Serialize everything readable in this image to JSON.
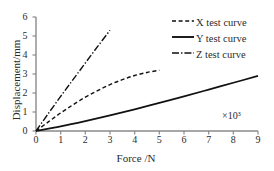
{
  "chart_data": {
    "type": "line",
    "title": "",
    "xlabel": "Force /N",
    "ylabel": "Displacement/mm",
    "x_multiplier": "×10³",
    "xlim": [
      0,
      9
    ],
    "ylim": [
      0,
      6
    ],
    "xticks": [
      0,
      1,
      2,
      3,
      4,
      5,
      6,
      7,
      8,
      9
    ],
    "yticks": [
      0,
      1,
      2,
      3,
      4,
      5,
      6
    ],
    "grid": false,
    "legend_position": "top-right",
    "series": [
      {
        "name": "X test curve",
        "style": "dashed",
        "color": "#111111",
        "x": [
          0,
          0.5,
          1.0,
          1.5,
          2.0,
          2.5,
          3.0,
          3.5,
          4.0,
          4.5,
          5.0
        ],
        "y": [
          0,
          0.48,
          0.95,
          1.38,
          1.78,
          2.12,
          2.44,
          2.7,
          2.92,
          3.08,
          3.2
        ]
      },
      {
        "name": "Y test curve",
        "style": "solid",
        "color": "#111111",
        "x": [
          0,
          1,
          2,
          3,
          4,
          5,
          6,
          7,
          8,
          9
        ],
        "y": [
          0,
          0.24,
          0.52,
          0.82,
          1.14,
          1.48,
          1.82,
          2.18,
          2.54,
          2.9
        ]
      },
      {
        "name": "Z test curve",
        "style": "dashdot",
        "color": "#111111",
        "x": [
          0,
          0.5,
          1.0,
          1.5,
          2.0,
          2.5,
          3.0
        ],
        "y": [
          0,
          0.92,
          1.82,
          2.7,
          3.58,
          4.45,
          5.3
        ]
      }
    ]
  },
  "axes": {
    "axis_color": "#8a8a8a",
    "xticklabels": [
      "0",
      "1",
      "2",
      "3",
      "4",
      "5",
      "6",
      "7",
      "8",
      "9"
    ],
    "yticklabels": [
      "0",
      "1",
      "2",
      "3",
      "4",
      "5",
      "6"
    ]
  }
}
